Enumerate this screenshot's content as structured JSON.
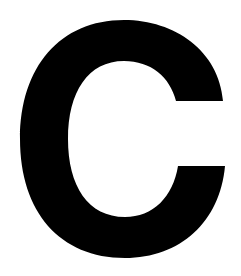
{
  "glyph": {
    "character": "C",
    "color": "#000000",
    "background": "#ffffff"
  }
}
